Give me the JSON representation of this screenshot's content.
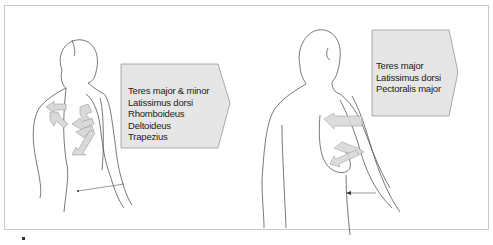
{
  "figure": {
    "left_panel": {
      "view": "posterior",
      "muscles": [
        "Teres major & minor",
        "Latissimus dorsi",
        "Rhomboideus",
        "Deltoideus",
        "Trapezius"
      ]
    },
    "right_panel": {
      "view": "posterior-lateral",
      "muscles": [
        "Teres major",
        "Latissimus dorsi",
        "Pectoralis major"
      ]
    },
    "colors": {
      "box_fill": "#e6e6e6",
      "box_stroke": "#8a8a8a",
      "arrow_fill": "#d9d9d9",
      "outline": "#555555",
      "frame": "#c8c8c8"
    }
  }
}
